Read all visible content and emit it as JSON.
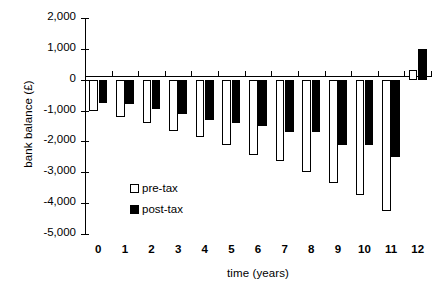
{
  "chart_data": {
    "type": "bar",
    "title": "",
    "xlabel": "time (years)",
    "ylabel": "bank balance (£)",
    "categories": [
      "0",
      "1",
      "2",
      "3",
      "4",
      "5",
      "6",
      "7",
      "8",
      "9",
      "10",
      "11",
      "12"
    ],
    "series": [
      {
        "name": "pre-tax",
        "values": [
          -1000,
          -1200,
          -1400,
          -1650,
          -1850,
          -2100,
          -2450,
          -2650,
          -3000,
          -3350,
          -3750,
          -4250,
          300
        ]
      },
      {
        "name": "post-tax",
        "values": [
          -750,
          -800,
          -950,
          -1100,
          -1300,
          -1400,
          -1500,
          -1700,
          -1700,
          -2100,
          -2100,
          -2500,
          1000
        ]
      }
    ],
    "ylim": [
      -5000,
      2000
    ],
    "ytick_labels": [
      "2,000",
      "1,000",
      "0",
      "-1,000",
      "-2,000",
      "-3,000",
      "-4,000",
      "-5,000"
    ],
    "ytick_values": [
      2000,
      1000,
      0,
      -1000,
      -2000,
      -3000,
      -4000,
      -5000
    ],
    "grid": false,
    "legend_position": "inside-lower-center",
    "colors": {
      "pre_tax_fill": "#ffffff",
      "post_tax_fill": "#000000",
      "axis": "#000000",
      "background": "#ffffff"
    }
  },
  "legend": {
    "entries": [
      {
        "label": "pre-tax",
        "swatch": "open-square-icon"
      },
      {
        "label": "post-tax",
        "swatch": "filled-square-icon"
      }
    ]
  }
}
